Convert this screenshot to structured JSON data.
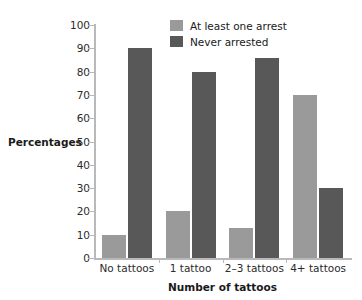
{
  "chart_data": {
    "type": "bar",
    "title": "",
    "subtitle": "",
    "xlabel": "Number of tattoos",
    "ylabel": "Percentages",
    "categories": [
      "No tattoos",
      "1 tattoo",
      "2–3 tattoos",
      "4+ tattoos"
    ],
    "series": [
      {
        "name": "At least one arrest",
        "color": "#9a9a9a",
        "values": [
          10,
          20,
          13,
          70
        ]
      },
      {
        "name": "Never arrested",
        "color": "#585858",
        "values": [
          90,
          80,
          86,
          30
        ]
      }
    ],
    "ylim": [
      0,
      100
    ],
    "yticks": [
      0,
      10,
      20,
      30,
      40,
      50,
      60,
      70,
      80,
      90,
      100
    ],
    "ytick_labels": [
      "0",
      "10",
      "20",
      "30",
      "40",
      "50",
      "60",
      "70",
      "80",
      "90",
      "100"
    ],
    "grid": false,
    "legend_position": "top-center",
    "background_color": "#ffffff",
    "axis_color": "#b9b9b9",
    "text_color": "#2b2b2b"
  }
}
